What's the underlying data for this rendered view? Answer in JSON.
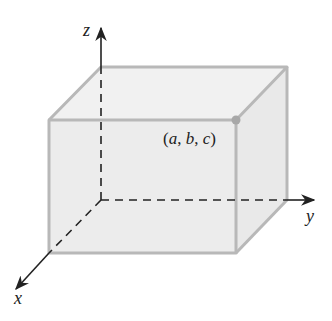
{
  "diagram": {
    "type": "3d-rectangular-box-in-coordinate-system",
    "axes": {
      "x": {
        "label": "x"
      },
      "y": {
        "label": "y"
      },
      "z": {
        "label": "z"
      }
    },
    "point": {
      "label": "(a, b, c)",
      "coords": [
        "a",
        "b",
        "c"
      ]
    },
    "colors": {
      "box_fill": "#ececec",
      "box_edge": "#b8b8b8",
      "axis": "#222222",
      "point": "#a8a8a8"
    }
  }
}
